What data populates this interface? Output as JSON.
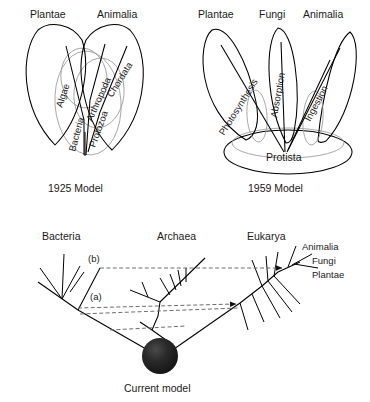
{
  "figure": {
    "panels": [
      {
        "id": "model-1925",
        "caption": "1925 Model",
        "top_labels": [
          "Plantae",
          "Animalia"
        ],
        "inner_labels": [
          "Algae",
          "Bacteria",
          "Protozoa",
          "Arthropoda",
          "Chordata"
        ]
      },
      {
        "id": "model-1959",
        "caption": "1959 Model",
        "top_labels": [
          "Plantae",
          "Fungi",
          "Animalia"
        ],
        "inner_labels": [
          "Photosynthesis",
          "Absorption",
          "Ingestion"
        ],
        "base_label": "Protista"
      },
      {
        "id": "model-current",
        "caption": "Current model",
        "domain_labels": [
          "Bacteria",
          "Archaea",
          "Eukarya"
        ],
        "crown_labels": [
          "Animalia",
          "Fungi",
          "Plantae"
        ],
        "event_markers": [
          "(a)",
          "(b)"
        ]
      }
    ]
  },
  "panel1": {
    "plantae": "Plantae",
    "animalia": "Animalia",
    "algae": "Algae",
    "bacteria": "Bacteria",
    "protozoa": "Protozoa",
    "arthropoda": "Arthropoda",
    "chordata": "Chordata",
    "caption": "1925 Model"
  },
  "panel2": {
    "plantae": "Plantae",
    "fungi": "Fungi",
    "animalia": "Animalia",
    "photosynthesis": "Photosynthesis",
    "absorption": "Absorption",
    "ingestion": "Ingestion",
    "protista": "Protista",
    "caption": "1959 Model"
  },
  "panel3": {
    "bacteria": "Bacteria",
    "archaea": "Archaea",
    "eukarya": "Eukarya",
    "animalia": "Animalia",
    "fungi": "Fungi",
    "plantae": "Plantae",
    "marker_a": "(a)",
    "marker_b": "(b)",
    "caption": "Current model"
  },
  "colors": {
    "ink": "#1a1a1a",
    "stroke": "#000000",
    "faint_stroke": "#9a9a9a",
    "dashed": "#6e6e6e",
    "sphere_dark": "#1b1b1b",
    "sphere_mid": "#3a3a3a",
    "background": "#ffffff"
  }
}
